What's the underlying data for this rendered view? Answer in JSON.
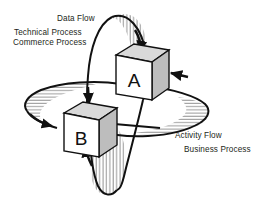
{
  "diagram": {
    "background_color": "#ffffff",
    "line_color": "#1a1a1a",
    "nodes": [
      {
        "id": "A",
        "label": "A",
        "shape": "isometric-cube",
        "front_face_color": "#ffffff",
        "top_face_color": "#d9d9d9",
        "side_face_color": "#bfbfbf"
      },
      {
        "id": "B",
        "label": "B",
        "shape": "isometric-cube",
        "front_face_color": "#ffffff",
        "top_face_color": "#d9d9d9",
        "side_face_color": "#bfbfbf"
      }
    ],
    "flows": {
      "vertical": {
        "name": "data-flow-loop",
        "orientation": "vertical-ellipse",
        "hatched": true,
        "labels": {
          "primary": "Data Flow",
          "secondary": "Technical Process",
          "tertiary": "Commerce Process"
        }
      },
      "horizontal": {
        "name": "activity-flow-loop",
        "orientation": "horizontal-ellipse",
        "hatched": true,
        "labels": {
          "primary": "Activity Flow",
          "secondary": "Business Process"
        }
      }
    },
    "arrows": [
      {
        "name": "arrow-into-cube-a-top",
        "target": "A",
        "face": "top",
        "direction": "down"
      },
      {
        "name": "arrow-into-cube-a-right",
        "target": "A",
        "face": "right",
        "direction": "left"
      },
      {
        "name": "arrow-into-cube-b-top",
        "target": "B",
        "face": "top",
        "direction": "down"
      },
      {
        "name": "arrow-into-cube-b-left",
        "target": "B",
        "face": "left",
        "direction": "right"
      },
      {
        "name": "arrow-into-cube-b-right",
        "target": "B",
        "face": "right",
        "direction": "left"
      },
      {
        "name": "arrow-into-cube-b-bottom",
        "target": "B",
        "face": "bottom",
        "direction": "up"
      }
    ]
  }
}
